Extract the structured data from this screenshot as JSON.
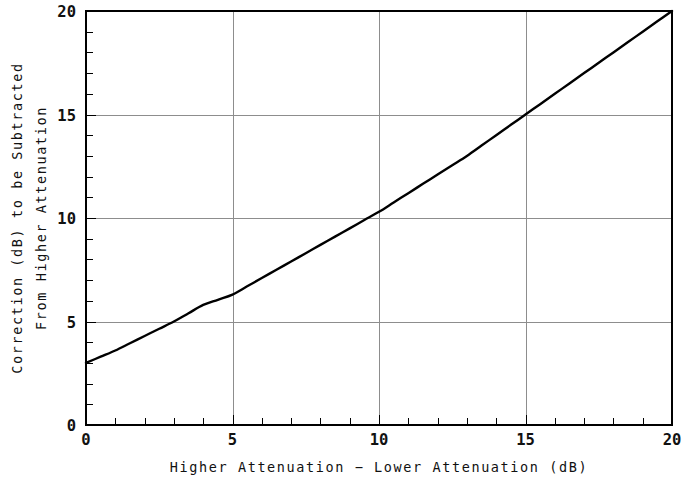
{
  "chart_data": {
    "type": "line",
    "title": "",
    "subtitle": "",
    "xlabel": "Higher Attenuation − Lower Attenuation (dB)",
    "ylabel_line1": "Correction (dB) to be Subtracted",
    "ylabel_line2": "From Higher Attenuation",
    "xlim": [
      0,
      20
    ],
    "ylim": [
      0,
      20
    ],
    "grid": true,
    "legend": "none",
    "x_major_ticks": [
      0,
      5,
      10,
      15,
      20
    ],
    "y_major_ticks": [
      0,
      5,
      10,
      15,
      20
    ],
    "x_tick_labels": [
      "0",
      "5",
      "10",
      "15",
      "20"
    ],
    "y_tick_labels": [
      "0",
      "5",
      "10",
      "15",
      "20"
    ],
    "x_minor_tick_interval": 1,
    "y_minor_tick_interval": 1,
    "curve_color": "#000000",
    "grid_color": "#8d8d8d",
    "frame_color": "#000000",
    "background_color": "#ffffff",
    "series": [
      {
        "name": "Attenuation correction",
        "x": [
          0,
          0.5,
          1,
          1.5,
          2,
          2.5,
          3,
          3.5,
          4,
          4.5,
          5,
          5.5,
          6,
          6.5,
          7,
          7.5,
          8,
          8.5,
          9,
          9.5,
          10,
          10.5,
          11,
          11.5,
          12,
          12.5,
          13,
          13.5,
          14,
          14.5,
          15,
          15.5,
          16,
          16.5,
          17,
          17.5,
          18,
          18.5,
          19,
          19.5,
          20
        ],
        "y": [
          3.0,
          3.3,
          3.6,
          3.95,
          4.3,
          4.65,
          5.0,
          5.4,
          5.8,
          6.05,
          6.3,
          6.7,
          7.1,
          7.5,
          7.9,
          8.3,
          8.7,
          9.1,
          9.5,
          9.9,
          10.3,
          10.75,
          11.2,
          11.65,
          12.1,
          12.55,
          13.0,
          13.5,
          14.0,
          14.5,
          15.0,
          15.5,
          16.0,
          16.5,
          17.0,
          17.5,
          18.0,
          18.5,
          19.0,
          19.5,
          20.0
        ]
      }
    ],
    "notable_points": [
      {
        "x": 0,
        "y": 3.0
      },
      {
        "x": 5,
        "y": 6.3
      },
      {
        "x": 10,
        "y": 10.3
      },
      {
        "x": 15,
        "y": 15.0
      },
      {
        "x": 20,
        "y": 20.0
      }
    ]
  }
}
